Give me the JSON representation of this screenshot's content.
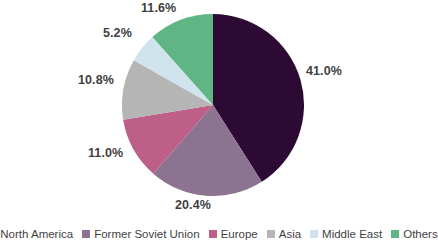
{
  "chart_data": {
    "type": "pie",
    "title": "",
    "subtitle": "",
    "xlabel": "",
    "ylabel": "",
    "legend_position": "bottom",
    "grid": false,
    "categories": [
      "North America",
      "Former Soviet Union",
      "Europe",
      "Asia",
      "Middle East",
      "Others"
    ],
    "values": [
      41.0,
      20.4,
      11.0,
      10.8,
      5.2,
      11.6
    ],
    "value_labels": [
      "41.0%",
      "20.4%",
      "11.0%",
      "10.8%",
      "5.2%",
      "11.6%"
    ],
    "colors": [
      "#2D0A33",
      "#8B7391",
      "#BD5F86",
      "#B5B5B5",
      "#CFE4EC",
      "#5FB584"
    ],
    "start_angle": 0,
    "direction": "clockwise",
    "slices": [
      {
        "name": "North America",
        "value": 41.0,
        "label": "41.0%",
        "color": "#2D0A33"
      },
      {
        "name": "Former Soviet Union",
        "value": 20.4,
        "label": "20.4%",
        "color": "#8B7391"
      },
      {
        "name": "Europe",
        "value": 11.0,
        "label": "11.0%",
        "color": "#BD5F86"
      },
      {
        "name": "Asia",
        "value": 10.8,
        "label": "10.8%",
        "color": "#B5B5B5"
      },
      {
        "name": "Middle East",
        "value": 5.2,
        "label": "5.2%",
        "color": "#CFE4EC"
      },
      {
        "name": "Others",
        "value": 11.6,
        "label": "11.6%",
        "color": "#5FB584"
      }
    ]
  },
  "labels": {
    "north_america": "41.0%",
    "former_soviet_union": "20.4%",
    "europe": "11.0%",
    "asia": "10.8%",
    "middle_east": "5.2%",
    "others": "11.6%"
  },
  "legend": {
    "items": [
      {
        "label": "North America",
        "color": "#2D0A33"
      },
      {
        "label": "Former Soviet Union",
        "color": "#8B7391"
      },
      {
        "label": "Europe",
        "color": "#BD5F86"
      },
      {
        "label": "Asia",
        "color": "#B5B5B5"
      },
      {
        "label": "Middle East",
        "color": "#CFE4EC"
      },
      {
        "label": "Others",
        "color": "#5FB584"
      }
    ]
  }
}
